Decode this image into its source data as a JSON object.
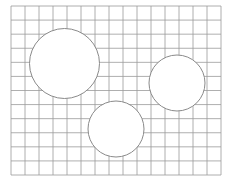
{
  "figure": {
    "type": "grid-with-circles",
    "background": "#ffffff",
    "grid": {
      "x0": 11,
      "y0": 6,
      "x1": 221,
      "y1": 175,
      "columns": 15,
      "rows": 12,
      "line_color": "#9a9a9a"
    },
    "circles": [
      {
        "cx": 64.5,
        "cy": 63.5,
        "r": 35,
        "fill": "#ffffff",
        "stroke": "#8a8a8a"
      },
      {
        "cx": 177,
        "cy": 83,
        "r": 28,
        "fill": "#ffffff",
        "stroke": "#8a8a8a"
      },
      {
        "cx": 116,
        "cy": 129,
        "r": 28,
        "fill": "#ffffff",
        "stroke": "#8a8a8a"
      }
    ]
  }
}
